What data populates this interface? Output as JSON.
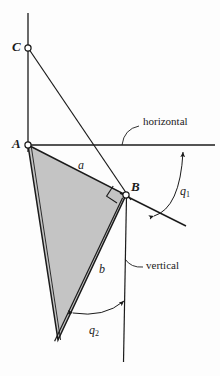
{
  "figure": {
    "background_color": "#fdfdfd",
    "stroke_color": "#1b1b1b",
    "fill_color": "#c4c4c4",
    "points": {
      "C": {
        "label": "C",
        "x": 28,
        "y": 48
      },
      "A": {
        "label": "A",
        "x": 28,
        "y": 145
      },
      "B": {
        "label": "B",
        "x": 126,
        "y": 195
      },
      "D": {
        "label": "",
        "x": 58,
        "y": 340
      }
    },
    "sides": [
      {
        "name": "a",
        "label": "a",
        "from": "A",
        "to": "B",
        "label_x": 78,
        "label_y": 159
      },
      {
        "name": "b",
        "label": "b",
        "from": "B",
        "to": "D",
        "label_x": 99,
        "label_y": 263
      }
    ],
    "angles": [
      {
        "name": "theta1",
        "label": "q",
        "subscript": "1",
        "label_x": 180,
        "label_y": 185
      },
      {
        "name": "theta2",
        "label": "q",
        "subscript": "2",
        "label_x": 89,
        "label_y": 324
      }
    ],
    "annotations": [
      {
        "name": "horizontal",
        "label": "horizontal",
        "label_x": 143,
        "label_y": 121
      },
      {
        "name": "vertical",
        "label": "vertical",
        "label_x": 146,
        "label_y": 264
      }
    ]
  }
}
